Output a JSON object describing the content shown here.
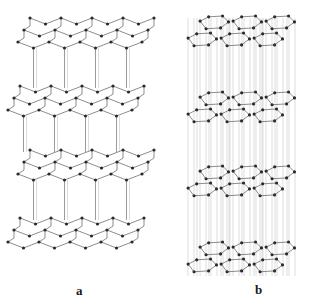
{
  "figure": {
    "panels": [
      {
        "id": "a",
        "label": "a",
        "description": "puckered (chair-form) hexagonal layers joined by vertical interlayer bonds"
      },
      {
        "id": "b",
        "label": "b",
        "description": "planar hexagonal sheets stacked with vertical guide lines"
      }
    ]
  },
  "style": {
    "bond_color": "#6f6f6f",
    "guide_color": "#b9b9b9",
    "atom_color": "#2b2b2b",
    "background": "#ffffff"
  },
  "panel_a": {
    "origin_x": 30,
    "layers_y": [
      18,
      86,
      150,
      218
    ],
    "layer_height": 40,
    "cells_x": 4,
    "cell_width": 31,
    "row_shift_x": -6,
    "rows_per_layer": 3,
    "row_dy": 12,
    "pucker": 6
  },
  "panel_b": {
    "origin_x": 212,
    "layers_y": [
      16,
      92,
      166,
      242
    ],
    "hex_cols": 3,
    "hex_rows": 2,
    "hex_w": 33,
    "hex_h": 17,
    "row_offset_x": -12,
    "row_offset_y": 17
  }
}
